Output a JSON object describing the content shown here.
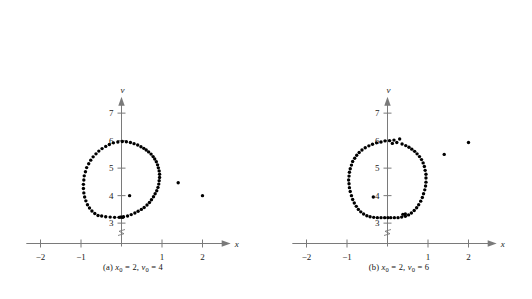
{
  "figure": {
    "type": "two-panel-scatter",
    "background": "#ffffff",
    "dot_color": "#000000",
    "axis_color": "#7a7a7a"
  },
  "chart_data": [
    {
      "type": "scatter",
      "panel": "a",
      "title": "",
      "caption_prefix": "(a)",
      "caption_x_var": "x",
      "caption_x_sub": "0",
      "caption_x_value": "2",
      "caption_v_var": "v",
      "caption_v_sub": "0",
      "caption_v_value": "4",
      "caption_text": "(a) x0 = 2, v0 = 4",
      "xlabel": "x",
      "ylabel": "v",
      "xlim": [
        -2.35,
        2.35
      ],
      "ylim": [
        2.55,
        7.45
      ],
      "xticks": [
        -2,
        -1,
        1,
        2
      ],
      "xtick_labels": [
        "-2",
        "-1",
        "1",
        "2"
      ],
      "yticks": [
        3,
        4,
        5,
        6,
        7
      ],
      "ytick_labels": [
        "3",
        "4",
        "5",
        "6",
        "7"
      ],
      "grid": false,
      "legend": "none",
      "axis_break_on": "v-axis-near-origin",
      "points": [
        [
          0.02,
          5.97
        ],
        [
          0.12,
          5.96
        ],
        [
          -0.09,
          5.95
        ],
        [
          0.22,
          5.93
        ],
        [
          -0.2,
          5.92
        ],
        [
          0.31,
          5.89
        ],
        [
          -0.3,
          5.86
        ],
        [
          0.4,
          5.84
        ],
        [
          -0.39,
          5.79
        ],
        [
          0.48,
          5.78
        ],
        [
          0.55,
          5.72
        ],
        [
          -0.48,
          5.71
        ],
        [
          0.61,
          5.66
        ],
        [
          -0.56,
          5.62
        ],
        [
          0.67,
          5.59
        ],
        [
          -0.63,
          5.52
        ],
        [
          0.73,
          5.51
        ],
        [
          0.78,
          5.42
        ],
        [
          -0.7,
          5.41
        ],
        [
          0.82,
          5.33
        ],
        [
          -0.76,
          5.29
        ],
        [
          0.86,
          5.23
        ],
        [
          -0.81,
          5.16
        ],
        [
          0.89,
          5.12
        ],
        [
          0.91,
          5.01
        ],
        [
          -0.86,
          5.02
        ],
        [
          0.93,
          4.9
        ],
        [
          -0.89,
          4.87
        ],
        [
          0.94,
          4.78
        ],
        [
          -0.92,
          4.72
        ],
        [
          0.94,
          4.66
        ],
        [
          -0.93,
          4.57
        ],
        [
          0.93,
          4.54
        ],
        [
          0.92,
          4.42
        ],
        [
          -0.94,
          4.41
        ],
        [
          0.9,
          4.3
        ],
        [
          -0.94,
          4.26
        ],
        [
          0.87,
          4.18
        ],
        [
          -0.93,
          4.1
        ],
        [
          0.83,
          4.07
        ],
        [
          -0.91,
          3.95
        ],
        [
          0.79,
          3.96
        ],
        [
          -0.88,
          3.81
        ],
        [
          0.74,
          3.85
        ],
        [
          0.69,
          3.75
        ],
        [
          -0.84,
          3.67
        ],
        [
          0.63,
          3.66
        ],
        [
          -0.79,
          3.55
        ],
        [
          0.56,
          3.57
        ],
        [
          -0.73,
          3.44
        ],
        [
          0.49,
          3.5
        ],
        [
          -0.66,
          3.35
        ],
        [
          0.41,
          3.43
        ],
        [
          -0.58,
          3.28
        ],
        [
          0.33,
          3.37
        ],
        [
          -0.49,
          3.26
        ],
        [
          0.24,
          3.31
        ],
        [
          -0.39,
          3.23
        ],
        [
          0.15,
          3.26
        ],
        [
          -0.28,
          3.22
        ],
        [
          0.05,
          3.23
        ],
        [
          -0.17,
          3.21
        ],
        [
          -0.06,
          3.21
        ],
        [
          0.0,
          3.22
        ],
        [
          0.03,
          3.21
        ],
        [
          -0.03,
          3.22
        ],
        [
          0.2,
          4.0
        ],
        [
          1.4,
          4.47
        ],
        [
          2.0,
          4.0
        ]
      ]
    },
    {
      "type": "scatter",
      "panel": "b",
      "title": "",
      "caption_prefix": "(b)",
      "caption_x_var": "x",
      "caption_x_sub": "0",
      "caption_x_value": "2",
      "caption_v_var": "v",
      "caption_v_sub": "0",
      "caption_v_value": "6",
      "caption_text": "(b) x0 = 2, v0 = 6",
      "xlabel": "x",
      "ylabel": "v",
      "xlim": [
        -2.35,
        2.35
      ],
      "ylim": [
        2.55,
        7.45
      ],
      "xticks": [
        -2,
        -1,
        1,
        2
      ],
      "xtick_labels": [
        "-2",
        "-1",
        "1",
        "2"
      ],
      "yticks": [
        3,
        4,
        5,
        6,
        7
      ],
      "ytick_labels": [
        "3",
        "4",
        "5",
        "6",
        "7"
      ],
      "grid": false,
      "legend": "none",
      "axis_break_on": "v-axis-near-origin",
      "points": [
        [
          0.3,
          6.06
        ],
        [
          0.16,
          6.02
        ],
        [
          0.05,
          6.0
        ],
        [
          -0.06,
          5.99
        ],
        [
          0.23,
          5.93
        ],
        [
          -0.16,
          5.95
        ],
        [
          0.12,
          5.9
        ],
        [
          -0.27,
          5.92
        ],
        [
          0.36,
          5.88
        ],
        [
          -0.37,
          5.87
        ],
        [
          0.45,
          5.82
        ],
        [
          -0.46,
          5.81
        ],
        [
          0.53,
          5.76
        ],
        [
          -0.55,
          5.74
        ],
        [
          0.6,
          5.69
        ],
        [
          -0.63,
          5.66
        ],
        [
          0.67,
          5.61
        ],
        [
          -0.7,
          5.57
        ],
        [
          0.73,
          5.52
        ],
        [
          -0.76,
          5.47
        ],
        [
          0.79,
          5.42
        ],
        [
          -0.81,
          5.36
        ],
        [
          0.84,
          5.31
        ],
        [
          -0.86,
          5.24
        ],
        [
          0.88,
          5.19
        ],
        [
          -0.89,
          5.11
        ],
        [
          0.91,
          5.06
        ],
        [
          -0.92,
          4.98
        ],
        [
          0.93,
          4.92
        ],
        [
          -0.94,
          4.85
        ],
        [
          0.95,
          4.78
        ],
        [
          -0.95,
          4.71
        ],
        [
          0.95,
          4.64
        ],
        [
          -0.96,
          4.57
        ],
        [
          0.95,
          4.49
        ],
        [
          -0.95,
          4.43
        ],
        [
          0.94,
          4.35
        ],
        [
          -0.94,
          4.29
        ],
        [
          0.92,
          4.21
        ],
        [
          -0.92,
          4.15
        ],
        [
          0.89,
          4.07
        ],
        [
          -0.89,
          4.0
        ],
        [
          0.86,
          3.93
        ],
        [
          -0.86,
          3.86
        ],
        [
          0.82,
          3.8
        ],
        [
          -0.82,
          3.73
        ],
        [
          0.77,
          3.67
        ],
        [
          -0.77,
          3.61
        ],
        [
          0.72,
          3.56
        ],
        [
          -0.72,
          3.5
        ],
        [
          0.66,
          3.46
        ],
        [
          -0.66,
          3.41
        ],
        [
          0.59,
          3.37
        ],
        [
          -0.59,
          3.33
        ],
        [
          0.52,
          3.3
        ],
        [
          -0.51,
          3.27
        ],
        [
          0.44,
          3.25
        ],
        [
          -0.43,
          3.23
        ],
        [
          0.35,
          3.22
        ],
        [
          -0.34,
          3.21
        ],
        [
          0.26,
          3.2
        ],
        [
          -0.25,
          3.2
        ],
        [
          0.17,
          3.2
        ],
        [
          -0.16,
          3.2
        ],
        [
          0.08,
          3.2
        ],
        [
          -0.07,
          3.2
        ],
        [
          0.01,
          3.2
        ],
        [
          0.38,
          3.32
        ],
        [
          0.44,
          3.33
        ],
        [
          -0.35,
          3.95
        ],
        [
          1.4,
          5.5
        ],
        [
          2.0,
          5.93
        ]
      ]
    }
  ]
}
